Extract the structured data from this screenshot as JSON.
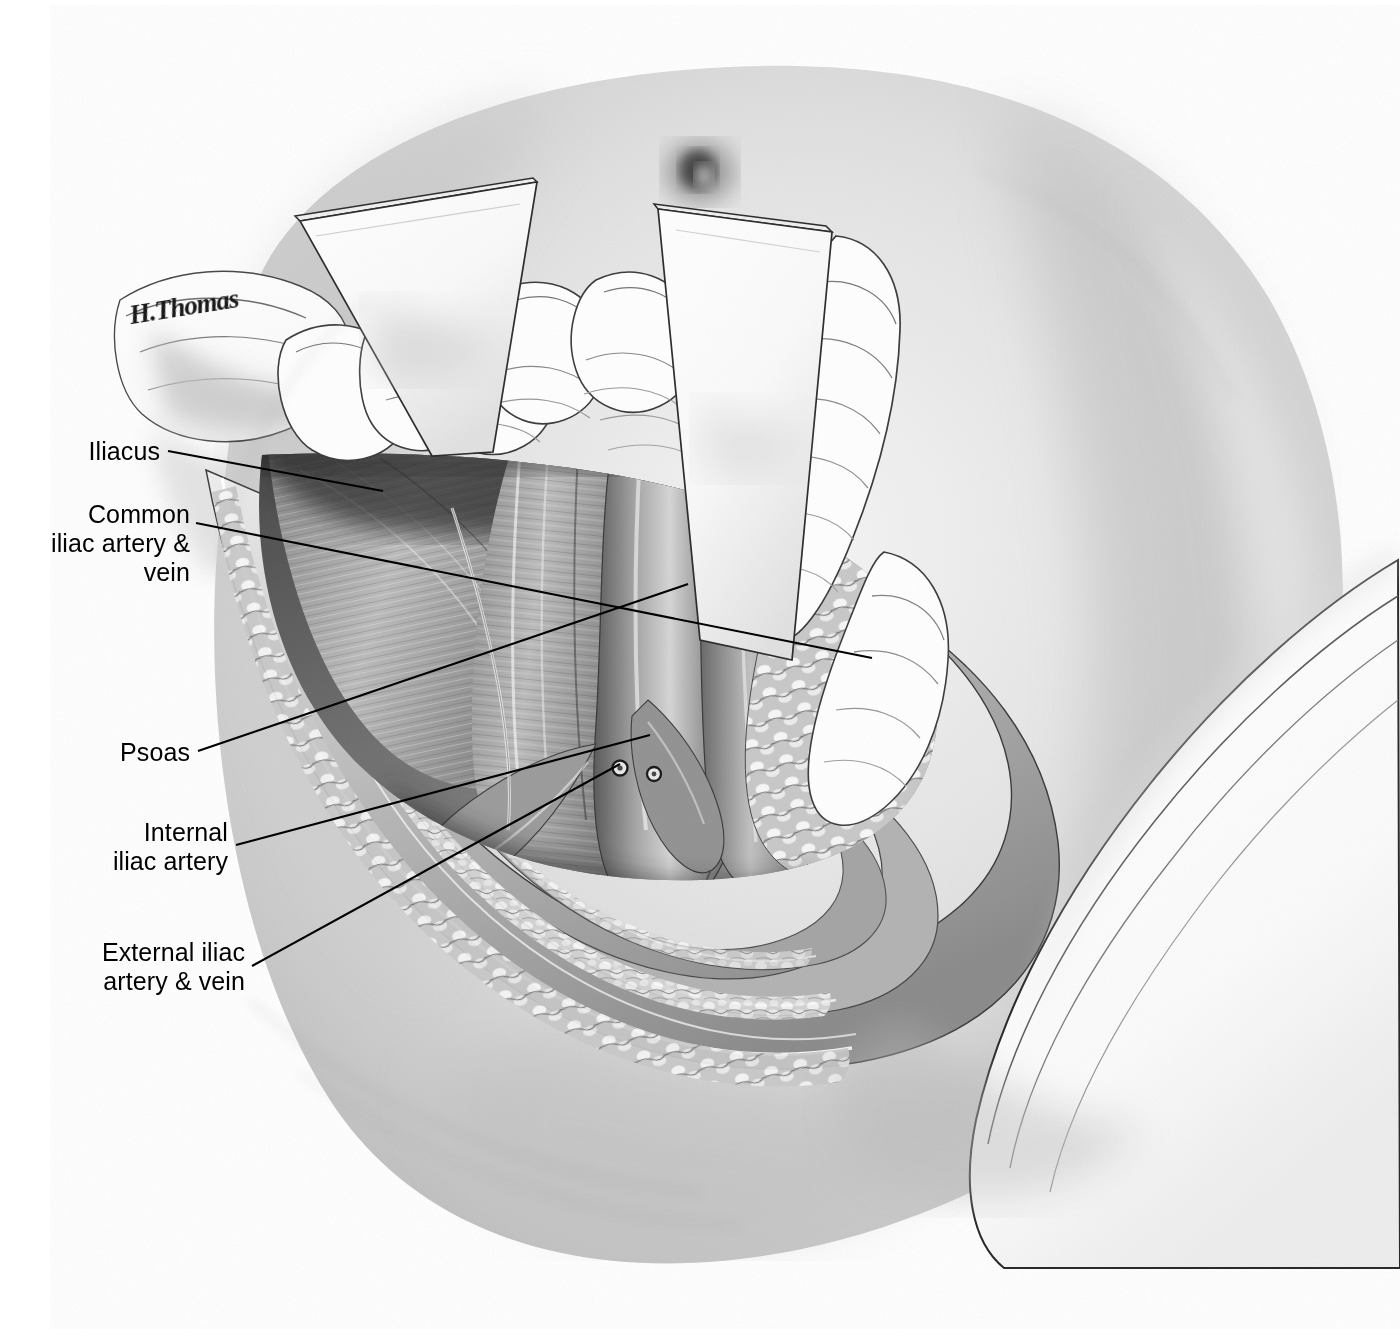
{
  "figure": {
    "kind": "medical-illustration",
    "technique": "airbrush-and-line pen-and-ink halftone, grayscale",
    "signature": "H.Thomas",
    "background_color": "#ffffff",
    "ink_color": "#000000"
  },
  "labels": [
    {
      "id": "iliacus",
      "text": "Iliacus",
      "lines": [
        "Iliacus"
      ],
      "align": "right",
      "x": 160,
      "y": 437,
      "leader": [
        [
          168,
          451
        ],
        [
          383,
          491
        ]
      ]
    },
    {
      "id": "common-iliac",
      "text": "Common iliac artery & vein",
      "lines": [
        "Common",
        "iliac artery &",
        "vein"
      ],
      "align": "right",
      "x": 190,
      "y": 500,
      "leader": [
        [
          196,
          523
        ],
        [
          872,
          658
        ]
      ]
    },
    {
      "id": "psoas",
      "text": "Psoas",
      "lines": [
        "Psoas"
      ],
      "align": "right",
      "x": 190,
      "y": 738,
      "leader": [
        [
          198,
          751
        ],
        [
          688,
          584
        ]
      ]
    },
    {
      "id": "internal-iliac",
      "text": "Internal iliac artery",
      "lines": [
        "Internal",
        "iliac artery"
      ],
      "align": "right",
      "x": 228,
      "y": 818,
      "leader": [
        [
          236,
          845
        ],
        [
          650,
          735
        ]
      ]
    },
    {
      "id": "external-iliac",
      "text": "External iliac artery & vein",
      "lines": [
        "External iliac",
        "artery & vein"
      ],
      "align": "right",
      "x": 245,
      "y": 938,
      "leader": [
        [
          252,
          966
        ],
        [
          620,
          764
        ]
      ]
    }
  ],
  "palette": {
    "paper": "#ffffff",
    "skin_light": "#f2f2f2",
    "skin_mid": "#d0d0d0",
    "skin_shadow": "#9a9a9a",
    "muscle_mid": "#9b9b9b",
    "muscle_dark": "#5e5e5e",
    "deep_shadow": "#3a3a3a",
    "fat_light": "#e8e8e8",
    "drape_white": "#ffffff",
    "outline": "#262626"
  },
  "structures": [
    {
      "name": "abdominal-skin-surface",
      "note": "broad gradient torso filling frame"
    },
    {
      "name": "surgical-drape-lower-right",
      "note": "white folded drape across lower right"
    },
    {
      "name": "drape-edge-upper-left",
      "note": "rolled drape edge under signature"
    },
    {
      "name": "retractor-blade-left",
      "note": "flat malleable blade held by gloved hand"
    },
    {
      "name": "retractor-blade-right",
      "note": "second flat blade, gloved fingers"
    },
    {
      "name": "gloved-fingers-left",
      "note": "three flexed fingers gripping left blade"
    },
    {
      "name": "gloved-fingers-right",
      "note": "fingers gripping right blade"
    },
    {
      "name": "umbilicus",
      "note": "dark smudge above right blade"
    },
    {
      "name": "wound-margin-layers",
      "note": "nested incision lip: skin, fat, fascia"
    },
    {
      "name": "subcutaneous-fat-lobules",
      "note": "cobblestone highlights along wound lip"
    },
    {
      "name": "iliacus-muscle",
      "note": "striated muscle floor of fossa"
    },
    {
      "name": "psoas-muscle",
      "note": "longitudinal striations, centre of field"
    },
    {
      "name": "common-iliac-vessels",
      "note": "paired tubular vessels at fossa apex"
    },
    {
      "name": "external-iliac-vessels",
      "note": "vessels running to lower wound corner"
    },
    {
      "name": "internal-iliac-artery",
      "note": "branch descending into pelvis"
    },
    {
      "name": "vessel-cross-sections",
      "note": "two small ring lumens at fossa base"
    },
    {
      "name": "ureter-strand",
      "note": "thin pale cord crossing vessels"
    },
    {
      "name": "peritoneal-fat-pad-right",
      "note": "nodular fat retracted to right"
    }
  ]
}
